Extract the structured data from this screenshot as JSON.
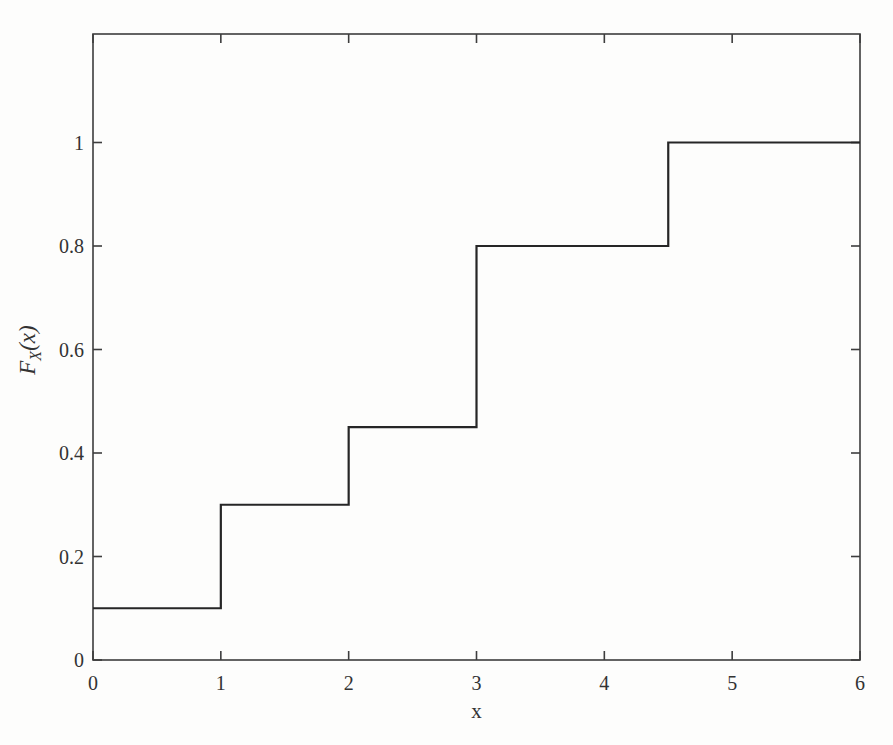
{
  "figure": {
    "background": "#fdfdfc",
    "xlabel": "x",
    "ylabel": "F_X(x)",
    "ylabel_parts": {
      "main": "F",
      "sub": "X",
      "rest": "(x)"
    }
  },
  "chart_data": {
    "type": "line",
    "style": "stairs-step-cdf",
    "title": "",
    "xlabel": "x",
    "ylabel": "F_X(x)",
    "xlim": [
      0,
      6
    ],
    "ylim": [
      0,
      1.2
    ],
    "xticks": [
      0,
      1,
      2,
      3,
      4,
      5,
      6
    ],
    "xtick_labels": [
      "0",
      "1",
      "2",
      "3",
      "4",
      "5",
      "6"
    ],
    "yticks": [
      0,
      0.2,
      0.4,
      0.6,
      0.8,
      1
    ],
    "ytick_labels": [
      "0",
      "0.2",
      "0.4",
      "0.6",
      "0.8",
      "1"
    ],
    "steps": [
      {
        "x_start": 0,
        "x_end": 1,
        "y": 0.1
      },
      {
        "x_start": 1,
        "x_end": 2,
        "y": 0.3
      },
      {
        "x_start": 2,
        "x_end": 3,
        "y": 0.45
      },
      {
        "x_start": 3,
        "x_end": 4.5,
        "y": 0.8
      },
      {
        "x_start": 4.5,
        "x_end": 6,
        "y": 1.0
      }
    ],
    "jump_x": [
      1,
      2,
      3,
      4.5
    ],
    "grid": false,
    "legend": "none",
    "line_color": "#262626",
    "axis_color": "#3d3d3d",
    "text_color": "#333333",
    "line_width": 2.2,
    "axis_width": 1.6
  }
}
